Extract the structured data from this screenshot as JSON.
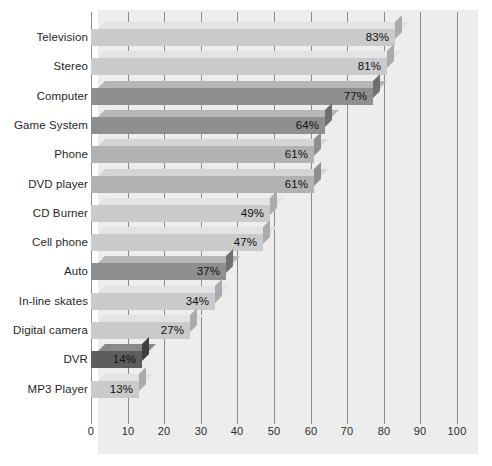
{
  "chart_data": {
    "type": "bar",
    "orientation": "horizontal",
    "title": "",
    "subtitle": "",
    "xlabel": "",
    "ylabel": "",
    "xlim": [
      0,
      100
    ],
    "ylim": null,
    "grid": true,
    "legend": null,
    "x_ticks": [
      "0",
      "10",
      "20",
      "30",
      "40",
      "50",
      "60",
      "70",
      "80",
      "90",
      "100"
    ],
    "x_tick_values": [
      0,
      10,
      20,
      30,
      40,
      50,
      60,
      70,
      80,
      90,
      100
    ],
    "x_tick_interval": 10,
    "categories": [
      "Television",
      "Stereo",
      "Computer",
      "Game System",
      "Phone",
      "DVD player",
      "CD Burner",
      "Cell phone",
      "Auto",
      "In-line skates",
      "Digital camera",
      "DVR",
      "MP3 Player"
    ],
    "values": [
      83,
      81,
      77,
      64,
      61,
      61,
      49,
      47,
      37,
      34,
      27,
      14,
      13
    ],
    "data_labels": [
      "83%",
      "81%",
      "77%",
      "64%",
      "61%",
      "61%",
      "49%",
      "47%",
      "37%",
      "34%",
      "27%",
      "14%",
      "13%"
    ],
    "bar_shades": [
      "light",
      "light",
      "dark",
      "dark",
      "medium",
      "medium",
      "light",
      "light",
      "dark",
      "light",
      "light",
      "darkest",
      "light"
    ],
    "colors": {
      "background": "#ffffff",
      "panel": "#eceded",
      "gridline": "#8c8c8c",
      "axis_text": "#2b2b2b",
      "category_text": "#1f1f1f",
      "value_text": "#111111",
      "bar_light_front": "#c9cacb",
      "bar_light_top": "#e2e3e3",
      "bar_light_side": "#a9abac",
      "bar_medium_front": "#b0b2b3",
      "bar_medium_top": "#d4d5d6",
      "bar_medium_side": "#8d8f90",
      "bar_dark_front": "#8d8f90",
      "bar_dark_top": "#b4b6b7",
      "bar_dark_side": "#6d6f70",
      "bar_darkest_front": "#5b5d5e",
      "bar_darkest_top": "#86888a",
      "bar_darkest_side": "#3c3e3f"
    }
  }
}
